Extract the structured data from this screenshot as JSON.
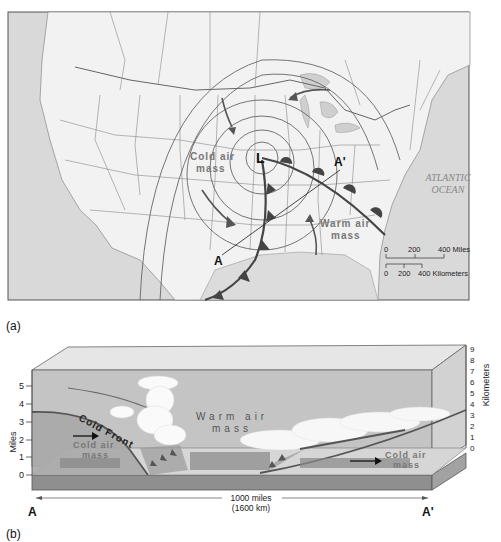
{
  "panel_a": {
    "caption": "(a)",
    "low_pressure_label": "L",
    "cold_air_mass": [
      "Cold air",
      "mass"
    ],
    "warm_air_mass": [
      "Warm air",
      "mass"
    ],
    "section_start": "A",
    "section_end": "A'",
    "ocean_label": [
      "ATLANTIC",
      "OCEAN"
    ],
    "scale": {
      "miles": [
        "0",
        "200",
        "400 Miles"
      ],
      "kilometers": [
        "0",
        "200",
        "400 Kilometers"
      ]
    }
  },
  "panel_b": {
    "caption": "(b)",
    "left_axis_title": "Miles",
    "left_axis_ticks": [
      "0",
      "1",
      "2",
      "3",
      "4",
      "5"
    ],
    "right_axis_title": "Kilometers",
    "right_axis_ticks": [
      "0",
      "1",
      "2",
      "3",
      "4",
      "5",
      "6",
      "7",
      "8",
      "9"
    ],
    "cold_front_label": "Cold Front",
    "warm_air_mass": [
      "Warm air",
      "mass"
    ],
    "cold_air_mass_left": [
      "Cold air",
      "mass"
    ],
    "cold_air_mass_right": [
      "Cold air",
      "mass"
    ],
    "distance": [
      "1000 miles",
      "(1600 km)"
    ],
    "section_start": "A",
    "section_end": "A'"
  },
  "colors": {
    "ocean": "#d8d8d8",
    "land": "#f1f1f1",
    "front_line": "#555555",
    "box_sky": "#b9b9b9",
    "box_ground": "#8f8f8f",
    "cold_air": "#a8a8a8"
  }
}
